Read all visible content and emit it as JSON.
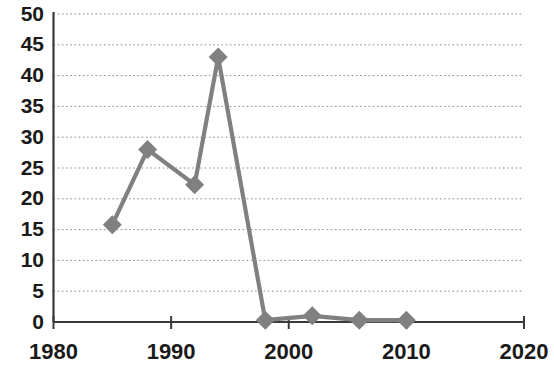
{
  "chart_data": {
    "type": "line",
    "title": "",
    "subtitle": "",
    "xlabel": "",
    "ylabel": "",
    "xlim": [
      1980,
      2020
    ],
    "ylim": [
      0,
      50
    ],
    "grid": true,
    "legend": "none",
    "marker": "diamond",
    "line_color": "#808080",
    "marker_color": "#808080",
    "x_ticks": [
      1980,
      1990,
      2000,
      2010,
      2020
    ],
    "x_tick_labels": [
      "1980",
      "1990",
      "2000",
      "2010",
      "2020"
    ],
    "y_ticks": [
      0,
      5,
      10,
      15,
      20,
      25,
      30,
      35,
      40,
      45,
      50
    ],
    "y_tick_labels": [
      "0",
      "5",
      "10",
      "15",
      "20",
      "25",
      "30",
      "35",
      "40",
      "45",
      "50"
    ],
    "series": [
      {
        "name": "series-1",
        "x": [
          1985,
          1988,
          1992,
          1994,
          1998,
          2002,
          2006,
          2010
        ],
        "values": [
          15.8,
          28.0,
          22.3,
          43.0,
          0.3,
          1.0,
          0.3,
          0.3
        ]
      }
    ]
  },
  "axes": {
    "y_axis_name": "value-axis",
    "x_axis_name": "year-axis"
  }
}
